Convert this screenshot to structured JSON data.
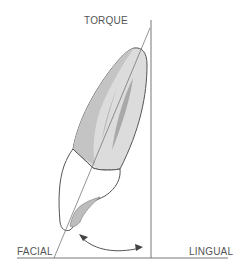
{
  "diagram": {
    "title": "TORQUE",
    "labels": {
      "top": "TORQUE",
      "left": "FACIAL",
      "right": "LINGUAL"
    },
    "elements": [
      "tooth-root",
      "tooth-crown",
      "pulp-canal",
      "long-axis-line",
      "vertical-reference-line",
      "baseline",
      "torque-angle-arrow"
    ],
    "colors": {
      "root_fill": "#c9c9c9",
      "root_light": "#dcdcdc",
      "pulp_fill": "#a9a9a9",
      "crown_fill": "#ffffff",
      "outline": "#555555",
      "line": "#777777"
    }
  }
}
